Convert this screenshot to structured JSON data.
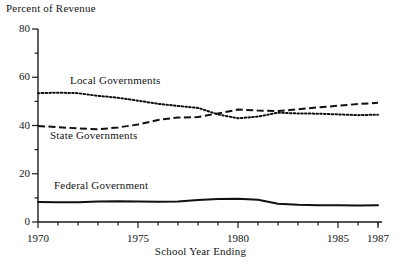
{
  "chart_data": {
    "type": "line",
    "title": "",
    "ylabel": "Percent of Revenue",
    "xlabel": "School Year Ending",
    "ylim": [
      0,
      80
    ],
    "xlim": [
      1970,
      1987
    ],
    "grid": false,
    "legend": "inline-labels",
    "ytick_labels": [
      "0",
      "20",
      "40",
      "60",
      "80"
    ],
    "ytick_values": [
      0,
      20,
      40,
      60,
      80
    ],
    "xtick_labels": [
      "1970",
      "1975",
      "1980",
      "1985",
      "1987"
    ],
    "xtick_values": [
      1970,
      1975,
      1980,
      1985,
      1987
    ],
    "x": [
      1970,
      1971,
      1972,
      1973,
      1974,
      1975,
      1976,
      1977,
      1978,
      1979,
      1980,
      1981,
      1982,
      1983,
      1984,
      1985,
      1986,
      1987
    ],
    "series": [
      {
        "name": "Local Governments",
        "style": "dotted",
        "label_x": 1971.6,
        "label_y": 58.5,
        "values": [
          53.4,
          53.6,
          53.4,
          52.3,
          51.5,
          50.3,
          49.0,
          48.1,
          47.3,
          44.6,
          43.0,
          43.7,
          45.3,
          45.0,
          44.9,
          44.6,
          44.3,
          44.5
        ]
      },
      {
        "name": "State Governments",
        "style": "dashed",
        "label_x": 1970.6,
        "label_y": 35.8,
        "values": [
          39.8,
          39.3,
          38.8,
          38.4,
          39.2,
          40.4,
          42.3,
          43.3,
          43.5,
          45.0,
          46.6,
          46.2,
          46.0,
          46.7,
          47.5,
          48.2,
          48.9,
          49.4
        ]
      },
      {
        "name": "Federal Government",
        "style": "solid",
        "label_x": 1970.8,
        "label_y": 15.0,
        "values": [
          8.3,
          8.2,
          8.2,
          8.5,
          8.6,
          8.5,
          8.4,
          8.5,
          9.1,
          9.5,
          9.6,
          9.2,
          7.6,
          7.1,
          6.9,
          6.9,
          6.8,
          6.9
        ]
      }
    ]
  },
  "axes": {
    "y_title": "Percent of Revenue",
    "x_title": "School Year Ending"
  }
}
